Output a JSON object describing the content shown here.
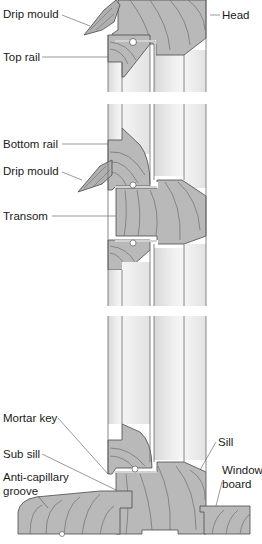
{
  "diagram": {
    "type": "cross-section",
    "colors": {
      "timber": "#b9b9b9",
      "timber_dark": "#a9a9a9",
      "grain": "#6e6e6e",
      "outline": "#4a4a4a",
      "glass_light": "#f2f2f2",
      "glass_shade": "#dcdcdc",
      "background": "#ffffff",
      "label_text": "#1a1a1a",
      "leader": "#555555"
    },
    "labels": {
      "drip_mould_top": "Drip mould",
      "head": "Head",
      "top_rail": "Top rail",
      "bottom_rail": "Bottom rail",
      "drip_mould_mid": "Drip mould",
      "transom": "Transom",
      "mortar_key": "Mortar key",
      "sub_sill": "Sub sill",
      "anti_capillary_1": "Anti-capillary",
      "anti_capillary_2": "groove",
      "sill": "Sill",
      "window_board_1": "Window",
      "window_board_2": "board"
    }
  }
}
